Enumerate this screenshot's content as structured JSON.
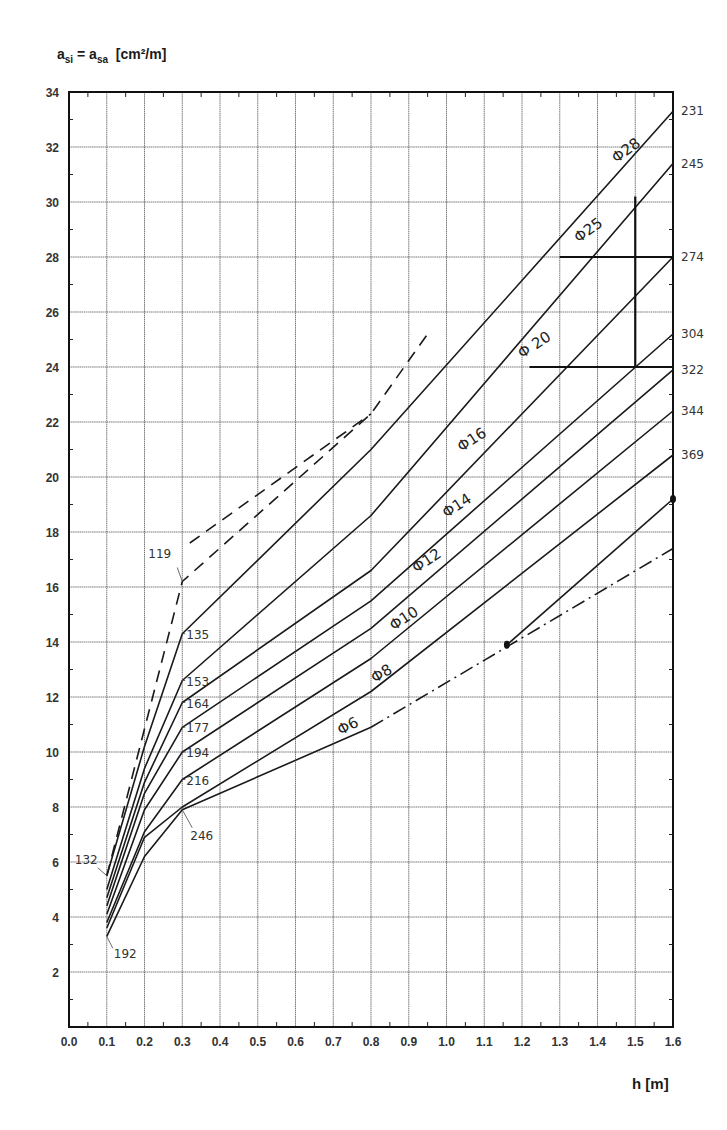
{
  "chart_data": {
    "type": "line",
    "title": "",
    "ylabel": "a_si = a_sa [cm²/m]",
    "ylabel_parts": {
      "a1": "a",
      "sub1": "si",
      "eq": " = a",
      "sub2": "sa",
      "unit": "  [cm²/m]"
    },
    "xlabel": "h [m]",
    "xlim": [
      0.0,
      1.6
    ],
    "ylim": [
      0,
      34
    ],
    "x_ticks": [
      "0.0",
      "0.1",
      "0.2",
      "0.3",
      "0.4",
      "0.5",
      "0.6",
      "0.7",
      "0.8",
      "0.9",
      "1.0",
      "1.1",
      "1.2",
      "1.3",
      "1.4",
      "1.5",
      "1.6"
    ],
    "y_ticks": [
      "2",
      "4",
      "6",
      "8",
      "10",
      "12",
      "14",
      "16",
      "18",
      "20",
      "22",
      "24",
      "26",
      "28",
      "30",
      "32",
      "34"
    ],
    "grid": true,
    "series": [
      {
        "name": "Φ28",
        "right_label": "231",
        "style": "solid",
        "x": [
          0.1,
          0.2,
          0.3,
          0.8,
          1.6
        ],
        "y": [
          5.5,
          10.2,
          14.3,
          21.0,
          33.3
        ]
      },
      {
        "name": "Φ25",
        "right_label": "245",
        "style": "solid",
        "x": [
          0.1,
          0.2,
          0.3,
          0.8,
          1.6
        ],
        "y": [
          5.0,
          9.4,
          12.6,
          18.6,
          31.4
        ]
      },
      {
        "name": "Φ20",
        "right_label": "274",
        "style": "solid",
        "x": [
          0.1,
          0.2,
          0.3,
          0.8,
          1.6
        ],
        "y": [
          4.7,
          8.9,
          11.8,
          16.6,
          28.0
        ]
      },
      {
        "name": "Φ16",
        "right_label": "304",
        "style": "solid",
        "x": [
          0.1,
          0.2,
          0.3,
          0.8,
          1.6
        ],
        "y": [
          4.4,
          8.5,
          10.9,
          15.5,
          25.2
        ]
      },
      {
        "name": "Φ14",
        "right_label": "322",
        "style": "solid",
        "x": [
          0.1,
          0.2,
          0.3,
          0.8,
          1.6
        ],
        "y": [
          4.1,
          7.9,
          10.0,
          14.5,
          23.9
        ]
      },
      {
        "name": "Φ12",
        "right_label": "344",
        "style": "solid",
        "x": [
          0.1,
          0.2,
          0.3,
          0.8,
          1.6
        ],
        "y": [
          3.8,
          7.1,
          9.0,
          13.4,
          22.4
        ]
      },
      {
        "name": "Φ10 / Φ8",
        "right_label": "369",
        "style": "solid",
        "x": [
          0.1,
          0.2,
          0.3,
          0.8,
          1.6
        ],
        "y": [
          3.6,
          6.9,
          8.0,
          12.2,
          20.8
        ]
      },
      {
        "name": "Φ6",
        "right_label": "",
        "style": "solid",
        "x": [
          0.1,
          0.2,
          0.3,
          0.8
        ],
        "y": [
          3.3,
          6.2,
          7.9,
          10.9
        ]
      },
      {
        "name": "Φ6 extension",
        "style": "dashdot",
        "x": [
          0.8,
          1.6
        ],
        "y": [
          10.9,
          17.4
        ]
      },
      {
        "name": "dashed lower (119)",
        "style": "dashed",
        "x": [
          0.1,
          0.3,
          0.8,
          0.95
        ],
        "y": [
          5.5,
          16.2,
          22.3,
          25.2
        ]
      },
      {
        "name": "dashed upper",
        "style": "dashed",
        "x": [
          0.32,
          0.8
        ],
        "y": [
          17.6,
          22.3
        ]
      },
      {
        "name": "example path",
        "style": "solid",
        "x": [
          1.16,
          1.6
        ],
        "y": [
          13.9,
          19.2
        ]
      }
    ],
    "left_labels": [
      {
        "text": "119",
        "x": 0.3,
        "y": 16.2
      },
      {
        "text": "135",
        "x": 0.3,
        "y": 14.3
      },
      {
        "text": "153",
        "x": 0.3,
        "y": 12.6
      },
      {
        "text": "164",
        "x": 0.3,
        "y": 11.8
      },
      {
        "text": "177",
        "x": 0.3,
        "y": 10.9
      },
      {
        "text": "194",
        "x": 0.3,
        "y": 10.0
      },
      {
        "text": "216",
        "x": 0.3,
        "y": 9.0
      },
      {
        "text": "246",
        "x": 0.3,
        "y": 7.9
      },
      {
        "text": "132",
        "x": 0.1,
        "y": 5.5
      },
      {
        "text": "192",
        "x": 0.1,
        "y": 3.3
      }
    ],
    "diameter_labels": [
      {
        "text": "Φ28",
        "x": 1.45,
        "y": 31.4,
        "angle": -36
      },
      {
        "text": "Φ25",
        "x": 1.35,
        "y": 28.5,
        "angle": -36
      },
      {
        "text": "Φ 20",
        "x": 1.2,
        "y": 24.3,
        "angle": -33
      },
      {
        "text": "Φ16",
        "x": 1.04,
        "y": 20.9,
        "angle": -33
      },
      {
        "text": "Φ14",
        "x": 1.0,
        "y": 18.5,
        "angle": -33
      },
      {
        "text": "Φ12",
        "x": 0.92,
        "y": 16.5,
        "angle": -33
      },
      {
        "text": "Φ10",
        "x": 0.86,
        "y": 14.4,
        "angle": -33
      },
      {
        "text": "Φ8",
        "x": 0.81,
        "y": 12.5,
        "angle": -30
      },
      {
        "text": "Φ6",
        "x": 0.72,
        "y": 10.6,
        "angle": -28
      }
    ],
    "annotations": [
      {
        "type": "bold-vertical",
        "x": 1.5,
        "y1": 24.0,
        "y2": 30.2
      },
      {
        "type": "bold-horizontal",
        "y": 28.0,
        "x1": 1.3,
        "x2": 1.6
      },
      {
        "type": "bold-horizontal",
        "y": 24.0,
        "x1": 1.22,
        "x2": 1.6
      },
      {
        "type": "point",
        "x": 1.16,
        "y": 13.9
      },
      {
        "type": "point",
        "x": 1.6,
        "y": 19.2
      }
    ]
  }
}
